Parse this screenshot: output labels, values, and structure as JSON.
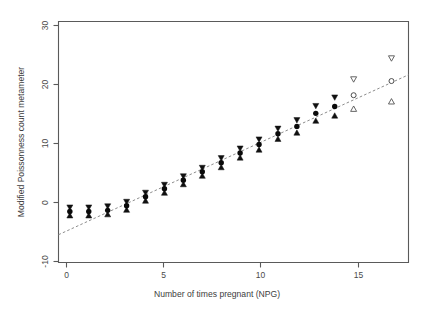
{
  "chart_data": {
    "type": "scatter",
    "title": "",
    "xlabel": "Number of times pregnant (NPG)",
    "ylabel": "Modified Poissonness count metameter",
    "xlim": [
      -0.6,
      17.9
    ],
    "ylim": [
      -11.0,
      31.5
    ],
    "xticks": [
      0,
      5,
      10,
      15
    ],
    "xticklabels": [
      "0",
      "5",
      "10",
      "15"
    ],
    "yticks": [
      -10,
      0,
      10,
      20,
      30
    ],
    "yticklabels": [
      "-10",
      "0",
      "10",
      "20",
      "30"
    ],
    "grid": false,
    "legend": null,
    "series": [
      {
        "name": "Modified count metameter with confidence interval",
        "marker": "filled-circle-with-triangles",
        "x": [
          0,
          1,
          2,
          3,
          4,
          5,
          6,
          7,
          8,
          9,
          10,
          11,
          12,
          13,
          14
        ],
        "y": [
          -2.0,
          -2.0,
          -1.8,
          -1.0,
          0.6,
          2.0,
          3.5,
          5.0,
          6.6,
          8.3,
          9.8,
          11.7,
          13.0,
          15.3,
          16.5
        ],
        "ci_upper": [
          -1.3,
          -1.3,
          -1.1,
          -0.3,
          1.3,
          2.7,
          4.2,
          5.7,
          7.4,
          9.1,
          10.7,
          12.6,
          14.1,
          16.6,
          18.1
        ],
        "ci_lower": [
          -2.7,
          -2.7,
          -2.5,
          -1.7,
          -0.1,
          1.3,
          2.8,
          4.3,
          5.8,
          7.5,
          8.9,
          10.8,
          11.9,
          14.0,
          14.9
        ]
      },
      {
        "name": "Sparse-count metameter with confidence interval",
        "marker": "open-circle-with-triangles",
        "x": [
          15,
          17
        ],
        "y": [
          18.5,
          21.0
        ],
        "ci_upper": [
          21.3,
          25.0
        ],
        "ci_lower": [
          16.1,
          17.4
        ]
      }
    ],
    "fit_line": {
      "name": "Fitted Poisson reference line",
      "style": "dashed",
      "x": [
        -0.6,
        17.9
      ],
      "y": [
        -6.1,
        22.1
      ]
    }
  },
  "axes": {
    "x_label": "Number of times pregnant (NPG)",
    "y_label": "Modified Poissonness count metameter",
    "x_tick_0": "0",
    "x_tick_1": "5",
    "x_tick_2": "10",
    "x_tick_3": "15",
    "y_tick_0": "-10",
    "y_tick_1": "0",
    "y_tick_2": "10",
    "y_tick_3": "20",
    "y_tick_4": "30"
  },
  "colors": {
    "background": "#ffffff",
    "axis": "#5a5a5a",
    "point_filled": "#0a0a0a",
    "point_open": "#ffffff",
    "fit_line": "#8d8d8d",
    "text": "#3d3d3d"
  }
}
